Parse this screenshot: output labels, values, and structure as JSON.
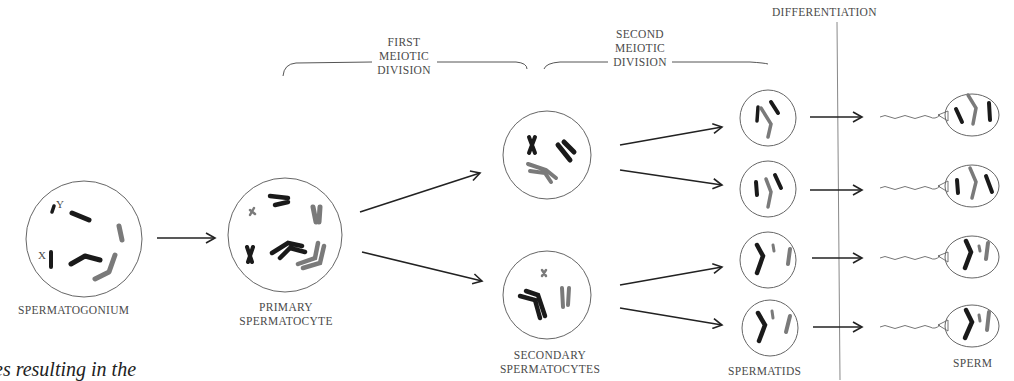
{
  "stages": {
    "spermatogonium": {
      "label": "SPERMATOGONIUM",
      "chromosome_labels": {
        "x": "X",
        "y": "Y"
      }
    },
    "primary_spermatocyte": {
      "line1": "PRIMARY",
      "line2": "SPERMATOCYTE"
    },
    "secondary_spermatocytes": {
      "line1": "SECONDARY",
      "line2": "SPERMATOCYTES"
    },
    "spermatids": {
      "label": "SPERMATIDS"
    },
    "sperm": {
      "label": "SPERM"
    }
  },
  "phases": {
    "first_meiotic": {
      "line1": "FIRST",
      "line2": "MEIOTIC",
      "line3": "DIVISION"
    },
    "second_meiotic": {
      "line1": "SECOND",
      "line2": "MEIOTIC",
      "line3": "DIVISION"
    },
    "differentiation": {
      "label": "DIFFERENTIATION"
    }
  },
  "caption_fragment": "es resulting in the",
  "colors": {
    "dark": "#1a1a1a",
    "grey": "#7a7a7a",
    "line": "#555555"
  }
}
